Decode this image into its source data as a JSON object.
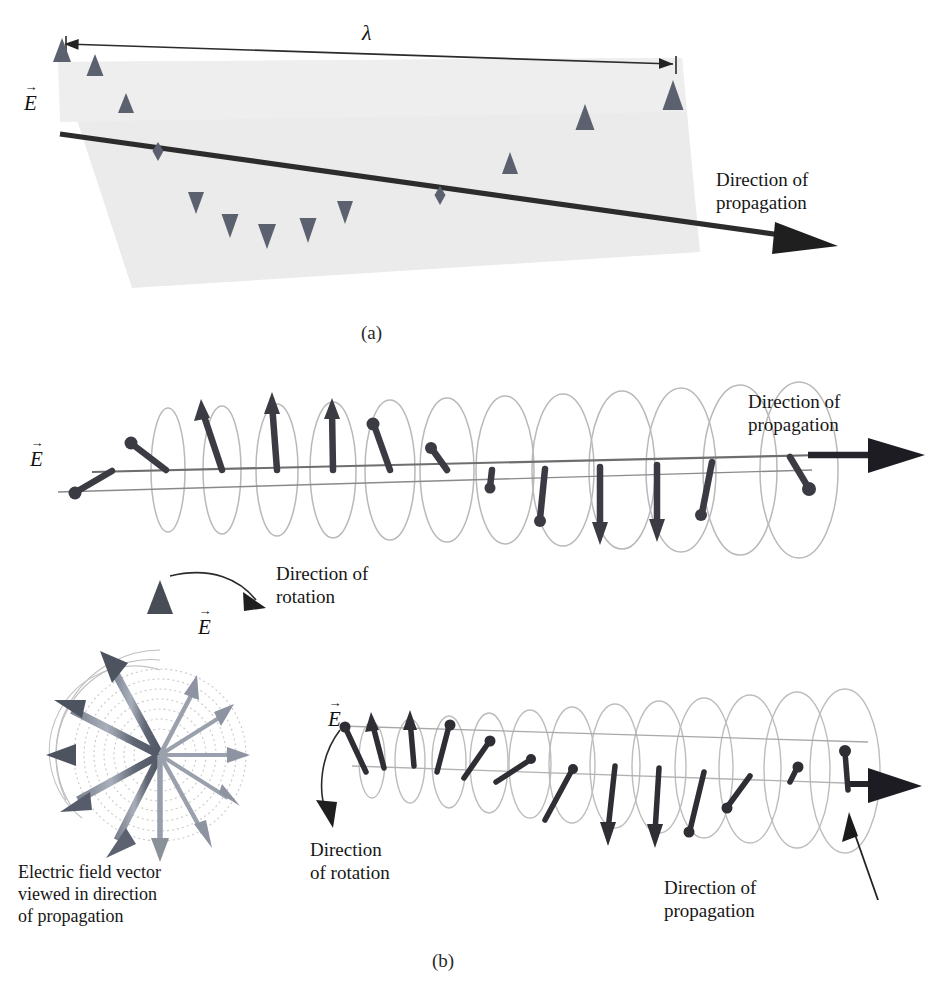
{
  "figure": {
    "title_labels": {
      "panel_a_id": "(a)",
      "panel_b_id": "(b)"
    },
    "symbols": {
      "e_vector": "E",
      "e_vector_accent": "→",
      "wavelength": "λ"
    },
    "panel_a": {
      "id": "(a)",
      "wavelength_label": "λ",
      "e_label": "E",
      "propagation_label": "Direction of\npropagation",
      "plane_fill": "#ebebeb",
      "arrow_color": "#5b616e",
      "axis_color": "#2b2b2b",
      "description": "Linearly polarized wave: electric field vectors confined to one plane",
      "arrows": [
        {
          "x": 62,
          "len": 88,
          "dir": "up",
          "w": 7.0
        },
        {
          "x": 95,
          "len": 78,
          "dir": "up",
          "w": 6.5
        },
        {
          "x": 126,
          "len": 52,
          "dir": "up",
          "w": 6.0
        },
        {
          "x": 158,
          "len": 6,
          "dir": "node",
          "w": 6.0
        },
        {
          "x": 196,
          "len": 52,
          "dir": "down",
          "w": 6.0
        },
        {
          "x": 230,
          "len": 78,
          "dir": "down",
          "w": 6.5
        },
        {
          "x": 267,
          "len": 88,
          "dir": "down",
          "w": 7.0
        },
        {
          "x": 308,
          "len": 78,
          "dir": "down",
          "w": 6.5
        },
        {
          "x": 345,
          "len": 52,
          "dir": "down",
          "w": 6.0
        },
        {
          "x": 440,
          "len": 6,
          "dir": "node",
          "w": 6.0
        },
        {
          "x": 510,
          "len": 52,
          "dir": "up",
          "w": 6.0
        },
        {
          "x": 585,
          "len": 98,
          "dir": "up",
          "w": 7.5
        },
        {
          "x": 673,
          "len": 118,
          "dir": "up",
          "w": 8.5
        }
      ]
    },
    "panel_b_middle": {
      "e_label": "E",
      "propagation_label": "Direction of\npropagation",
      "ellipse_color": "#b9b9b9",
      "arrow_color": "#3b3b43",
      "axis_color": "#6e6e6e",
      "description": "Circularly polarized wave shown as rotating field vectors along the axis",
      "ring_count": 13
    },
    "panel_b_star": {
      "e_label": "E",
      "rotation_label": "Direction of\nrotation",
      "caption": "Electric field vector\nviewed in direction\nof propagation",
      "arc_color": "#c9c9c9",
      "arrow_color": "#6b7280",
      "arrow_color_dark": "#4a4f5c",
      "description": "Electric field vector viewed end-on, rotating through 12 sampled orientations",
      "vector_count": 12
    },
    "panel_b_helix": {
      "e_label": "E",
      "rotation_label": "Direction\nof rotation",
      "propagation_label": "Direction of\npropagation",
      "ellipse_color": "#bdbdbd",
      "arrow_color": "#2e2e34",
      "axis_color": "#9a9a9a",
      "description": "Helical trace of the rotating electric field vector along the propagation axis",
      "ring_count": 13
    }
  }
}
